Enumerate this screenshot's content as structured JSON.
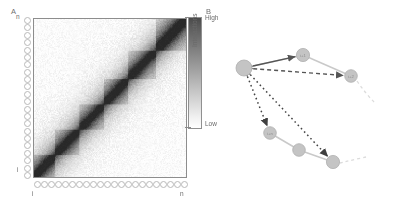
{
  "figure": {
    "panels": [
      {
        "letter": "A",
        "name": "contact-map-panel"
      },
      {
        "letter": "B",
        "name": "interaction-network-panel"
      }
    ]
  },
  "panel_a": {
    "letter": "A",
    "axis": {
      "y_top_label": "n",
      "y_bottom_label": "i",
      "x_left_label": "i",
      "x_right_label": "n",
      "bead_count_vertical": 22,
      "bead_count_horizontal": 22
    },
    "colorbar": {
      "title": "Interactions",
      "high_label": "High",
      "low_label": "Low",
      "high_color": "#4a4a4a",
      "low_color": "#ffffff"
    }
  },
  "panel_b": {
    "letter": "B",
    "nodes": [
      {
        "id": "hub",
        "label": "",
        "cx": 44,
        "cy": 68,
        "r": 8.0
      },
      {
        "id": "n-up",
        "label": "i+1",
        "cx": 103,
        "cy": 55,
        "r": 6.6
      },
      {
        "id": "n-rt",
        "label": "i+2",
        "cx": 151,
        "cy": 76,
        "r": 6.3
      },
      {
        "id": "n-dl",
        "label": "i+n",
        "cx": 70,
        "cy": 133,
        "r": 6.3
      },
      {
        "id": "n-dm",
        "label": "",
        "cx": 99,
        "cy": 150,
        "r": 6.3
      },
      {
        "id": "n-dr",
        "label": "",
        "cx": 133,
        "cy": 162,
        "r": 6.6
      }
    ],
    "edges": [
      {
        "from": "hub",
        "to": "n-up",
        "style": "solid",
        "arrows": "both",
        "color": "#555555"
      },
      {
        "from": "hub",
        "to": "n-rt",
        "style": "dashed",
        "arrows": "both",
        "color": "#555555"
      },
      {
        "from": "hub",
        "to": "n-dl",
        "style": "dotted",
        "arrows": "both",
        "color": "#444444"
      },
      {
        "from": "hub",
        "to": "n-dr",
        "style": "dotted",
        "arrows": "both",
        "color": "#444444"
      }
    ],
    "backbone_color": "#c9c9c9",
    "node_fill": "#c4c4c4",
    "node_stroke": "#b0b0b0"
  },
  "chart_data": {
    "type": "heatmap",
    "title": "",
    "xlabel": "",
    "ylabel": "",
    "x_tick_labels": [
      "i",
      "n"
    ],
    "y_tick_labels": [
      "i",
      "n"
    ],
    "colorbar": {
      "label": "Interactions",
      "min_label": "Low",
      "max_label": "High"
    },
    "grid": false,
    "domains": [
      {
        "start": 0.0,
        "end": 0.14,
        "intensity": 0.8
      },
      {
        "start": 0.14,
        "end": 0.3,
        "intensity": 0.72
      },
      {
        "start": 0.3,
        "end": 0.46,
        "intensity": 0.66
      },
      {
        "start": 0.46,
        "end": 0.62,
        "intensity": 0.74
      },
      {
        "start": 0.62,
        "end": 0.8,
        "intensity": 0.7
      },
      {
        "start": 0.8,
        "end": 1.0,
        "intensity": 0.88
      }
    ],
    "diagonal_intensity": 0.95,
    "offdiagonal_decay": 0.11
  }
}
